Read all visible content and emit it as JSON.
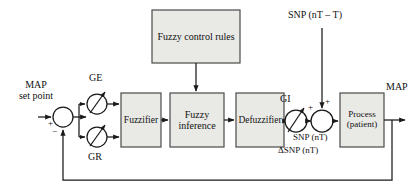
{
  "diagram": {
    "type": "block-diagram",
    "colors": {
      "block_fill": "#e9e9e6",
      "block_stroke": "#4a4a4a",
      "line": "#1a1a1a",
      "text": "#111111",
      "background": "#ffffff"
    },
    "blocks": [
      {
        "id": "fuzzy-control-rules",
        "label": "Fuzzy control rules",
        "lines": [
          "Fuzzy control rules"
        ],
        "x": 152,
        "y": 10,
        "w": 88,
        "h": 53
      },
      {
        "id": "fuzzifier",
        "label": "Fuzzifier",
        "lines": [
          "Fuzzifier"
        ],
        "x": 121,
        "y": 93,
        "w": 40,
        "h": 54
      },
      {
        "id": "fuzzy-inference",
        "label": "Fuzzy inference",
        "lines": [
          "Fuzzy",
          "inference"
        ],
        "x": 170,
        "y": 93,
        "w": 54,
        "h": 54
      },
      {
        "id": "defuzzifier",
        "label": "Defuzzifier",
        "lines": [
          "Defuzzifier"
        ],
        "x": 236,
        "y": 93,
        "w": 48,
        "h": 54
      },
      {
        "id": "process-patient",
        "label": "Process (patient)",
        "lines": [
          "Process",
          "(patient)"
        ],
        "x": 340,
        "y": 93,
        "w": 44,
        "h": 54
      }
    ],
    "summers": [
      {
        "id": "error-summer",
        "cx": 63,
        "cy": 117,
        "r": 10,
        "signs": [
          {
            "text": "+",
            "x": 49,
            "y": 122
          },
          {
            "text": "−",
            "x": 54,
            "y": 131
          }
        ]
      },
      {
        "id": "snp-summer",
        "cx": 322,
        "cy": 121,
        "r": 11,
        "signs": [
          {
            "text": "+",
            "x": 309,
            "y": 105
          },
          {
            "text": "+",
            "x": 325,
            "y": 101
          }
        ]
      }
    ],
    "gains": [
      {
        "id": "gain-ge",
        "label": "GE",
        "cx": 97,
        "cy": 104,
        "r": 10,
        "label_x": 89,
        "label_y": 78
      },
      {
        "id": "gain-gr",
        "label": "GR",
        "cx": 97,
        "cy": 137,
        "r": 10,
        "label_x": 89,
        "label_y": 157
      },
      {
        "id": "gain-gi",
        "label": "GI",
        "cx": 296,
        "cy": 121,
        "r": 11,
        "label_x": 282,
        "label_y": 97
      }
    ],
    "labels": [
      {
        "id": "map-set-point",
        "lines": [
          "MAP",
          "set point"
        ],
        "x": 16,
        "y": 82,
        "size": 10,
        "align": "center"
      },
      {
        "id": "snp-delayed-input",
        "text": "SNP (nT – T)",
        "x": 289,
        "y": 14,
        "size": 10
      },
      {
        "id": "snp-nt",
        "text": "SNP (nT)",
        "x": 293,
        "y": 138,
        "size": 9
      },
      {
        "id": "delta-snp-nt",
        "text": "ΔSNP (nT)",
        "x": 279,
        "y": 150,
        "size": 9
      },
      {
        "id": "map-output",
        "text": "MAP",
        "x": 387,
        "y": 88,
        "size": 10
      }
    ],
    "signals": [
      {
        "id": "setpoint-to-summer",
        "from": "MAP set point",
        "to": "error-summer"
      },
      {
        "id": "summer-to-gains",
        "from": "error-summer",
        "to": "GE and GR gains"
      },
      {
        "id": "gains-to-fuzzifier",
        "from": "GE / GR",
        "to": "fuzzifier"
      },
      {
        "id": "fuzzifier-to-inference",
        "from": "fuzzifier",
        "to": "fuzzy-inference"
      },
      {
        "id": "rules-to-inference",
        "from": "fuzzy-control-rules",
        "to": "fuzzy-inference"
      },
      {
        "id": "inference-to-defuzzifier",
        "from": "fuzzy-inference",
        "to": "defuzzifier"
      },
      {
        "id": "defuzzifier-to-gi",
        "from": "defuzzifier",
        "to": "gain-gi"
      },
      {
        "id": "gi-to-snp-summer",
        "from": "gain-gi",
        "to": "snp-summer"
      },
      {
        "id": "snp-delay-to-summer",
        "from": "SNP (nT – T)",
        "to": "snp-summer"
      },
      {
        "id": "snp-summer-to-process",
        "from": "snp-summer",
        "to": "process-patient"
      },
      {
        "id": "process-to-map-output",
        "from": "process-patient",
        "to": "MAP"
      },
      {
        "id": "feedback-path",
        "from": "MAP output",
        "to": "error-summer (negative)"
      }
    ]
  }
}
